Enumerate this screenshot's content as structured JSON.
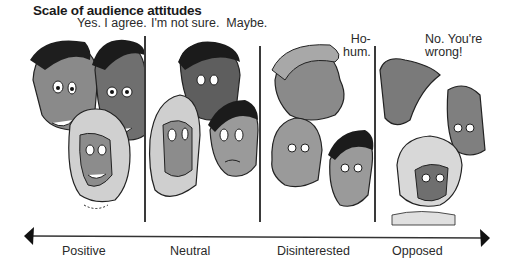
{
  "title": "Scale of audience attitudes",
  "panels": [
    {
      "id": "positive",
      "speech": "Yes. I agree.",
      "label": "Positive"
    },
    {
      "id": "neutral",
      "speech": "I'm not sure.  Maybe.",
      "label": "Neutral"
    },
    {
      "id": "disinterested",
      "speech": "Ho-\nhum.",
      "label": "Disinterested"
    },
    {
      "id": "opposed",
      "speech": "No. You're\nwrong!",
      "label": "Opposed"
    }
  ],
  "axis": {
    "direction": "bidirectional",
    "left_end": "Positive",
    "right_end": "Opposed"
  },
  "colors": {
    "ink": "#1a1a1a",
    "shade_dark": "#6b6b6b",
    "shade_mid": "#9a9a9a",
    "shade_light": "#c8c8c8",
    "background": "#ffffff"
  }
}
